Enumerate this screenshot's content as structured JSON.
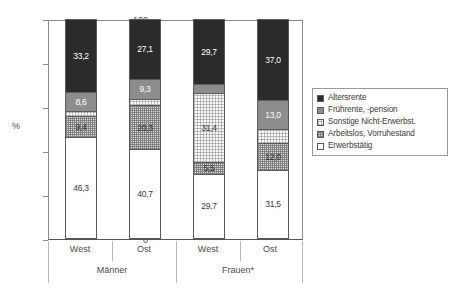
{
  "chart_data": {
    "type": "bar",
    "subtype": "stacked-100",
    "title": "",
    "xlabel": "",
    "ylabel": "%",
    "ylim": [
      0,
      100
    ],
    "yticks": [
      "0",
      "20",
      "40",
      "60",
      "80",
      "100"
    ],
    "grid": false,
    "legend_position": "right",
    "categories": [
      "West",
      "Ost",
      "West",
      "Ost"
    ],
    "groups": [
      {
        "label": "Männer",
        "categories": [
          "West",
          "Ost"
        ]
      },
      {
        "label": "Frauen*",
        "categories": [
          "West",
          "Ost"
        ]
      }
    ],
    "series": [
      {
        "name": "Altersrente",
        "color": "#2b2b2b",
        "values": [
          33.2,
          27.1,
          29.7,
          37.0
        ],
        "labels": [
          "33,2",
          "27,1",
          "29,7",
          "37,0"
        ]
      },
      {
        "name": "Frührente, -pension",
        "color": "#8d8d8d",
        "values": [
          8.6,
          9.3,
          3.7,
          13.0
        ],
        "labels": [
          "8,6",
          "9,3",
          "",
          "13,0"
        ]
      },
      {
        "name": "Sonstige Nicht-Erwerbst.",
        "color": "#fbfbfb",
        "values": [
          2.5,
          2.6,
          31.4,
          6.5
        ],
        "labels": [
          "",
          "",
          "31,4",
          ""
        ]
      },
      {
        "name": "Arbeitslos, Vorruhestand",
        "color": "#dcdcdc",
        "values": [
          9.4,
          20.3,
          5.5,
          12.0
        ],
        "labels": [
          "9,4",
          "20,3",
          "5,5",
          "12,0"
        ]
      },
      {
        "name": "Erwerbstätig",
        "color": "#ffffff",
        "values": [
          46.3,
          40.7,
          29.7,
          31.5
        ],
        "labels": [
          "46,3",
          "40,7",
          "29,7",
          "31,5"
        ]
      }
    ]
  },
  "legend": {
    "items": [
      {
        "label": "Altersrente"
      },
      {
        "label": "Frührente, -pension"
      },
      {
        "label": "Sonstige Nicht-Erwerbst."
      },
      {
        "label": "Arbeitslos, Vorruhestand"
      },
      {
        "label": "Erwerbstätig"
      }
    ]
  }
}
